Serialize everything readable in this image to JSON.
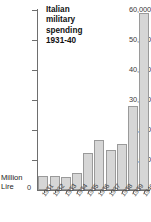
{
  "chart_data": {
    "type": "bar",
    "title": "Italian military spending 1931-40",
    "title_lines": [
      "Italian",
      "military",
      "spending",
      "1931-40"
    ],
    "xlabel": "",
    "ylabel": "Million Lire",
    "ylabel_lines": [
      "Million",
      "Lire"
    ],
    "categories": [
      "1931",
      "1932",
      "1933",
      "1934",
      "1935",
      "1936",
      "1937",
      "1938",
      "1939",
      "1940"
    ],
    "values": [
      4800,
      4800,
      4200,
      5600,
      12500,
      16700,
      13500,
      15200,
      28000,
      59000
    ],
    "ylim": [
      0,
      60000
    ],
    "ytick_values": [
      0,
      10000,
      20000,
      30000,
      40000,
      50000,
      60000
    ],
    "ytick_labels": [
      "0",
      "10,000",
      "20,000",
      "30,000",
      "40,000",
      "50,000",
      "60,000"
    ],
    "grid": false,
    "legend": null,
    "bar_fill_color": "#d6d6d6",
    "bar_border_color": "#9a9a9a",
    "axis_color": "#6e6e6e",
    "text_color": "#3a3a3a"
  }
}
